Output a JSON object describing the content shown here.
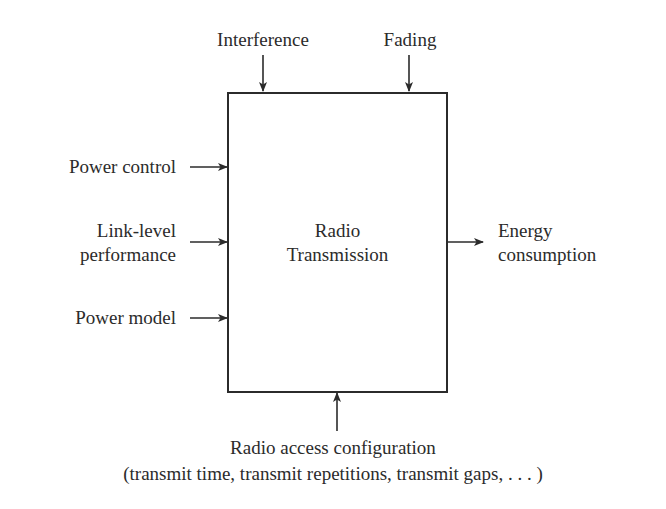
{
  "diagram": {
    "block": {
      "line1": "Radio",
      "line2": "Transmission"
    },
    "top_inputs": [
      {
        "label": "Interference"
      },
      {
        "label": "Fading"
      }
    ],
    "left_inputs": [
      {
        "label_line1": "Power control"
      },
      {
        "label_line1": "Link-level",
        "label_line2": "performance"
      },
      {
        "label_line1": "Power model"
      }
    ],
    "output": {
      "label_line1": "Energy",
      "label_line2": "consumption"
    },
    "bottom_input": {
      "label_line1": "Radio access configuration",
      "label_line2": "(transmit time, transmit repetitions, transmit gaps, . . . )"
    },
    "colors": {
      "stroke": "#2b2b2b",
      "background": "#ffffff",
      "text": "#2b2b2b"
    }
  }
}
